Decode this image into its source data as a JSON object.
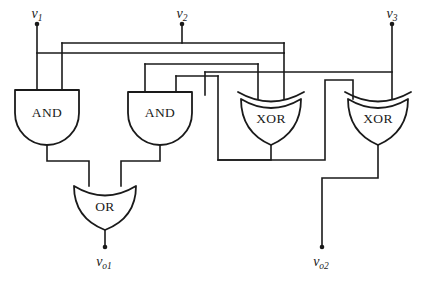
{
  "figure": {
    "type": "logic-circuit-diagram",
    "width": 439,
    "height": 283,
    "background_color": "#ffffff",
    "line_color": "#1a1a1a"
  },
  "inputs": [
    {
      "id": "v1",
      "base": "v",
      "sub": "1",
      "x": 37,
      "y": 18
    },
    {
      "id": "v2",
      "base": "v",
      "sub": "2",
      "x": 182,
      "y": 18
    },
    {
      "id": "v3",
      "base": "v",
      "sub": "3",
      "x": 392,
      "y": 18
    }
  ],
  "outputs": [
    {
      "id": "vo1",
      "base": "v",
      "sub": "o1",
      "x": 105,
      "y": 262
    },
    {
      "id": "vo2",
      "base": "v",
      "sub": "o2",
      "x": 322,
      "y": 262
    }
  ],
  "gates": [
    {
      "id": "and1",
      "label": "AND",
      "cx": 47,
      "cy": 113,
      "type": "and"
    },
    {
      "id": "and2",
      "label": "AND",
      "cx": 160,
      "cy": 113,
      "type": "and"
    },
    {
      "id": "xor1",
      "label": "XOR",
      "cx": 271,
      "cy": 117,
      "type": "xor"
    },
    {
      "id": "xor2",
      "label": "XOR",
      "cx": 378,
      "cy": 117,
      "type": "xor"
    },
    {
      "id": "or1",
      "label": "OR",
      "cx": 105,
      "cy": 207,
      "type": "or"
    }
  ]
}
